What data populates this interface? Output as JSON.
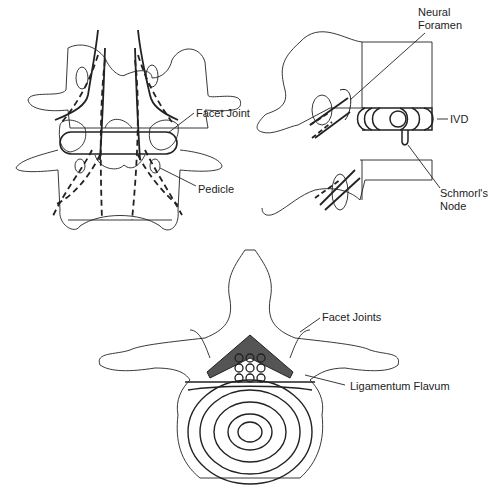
{
  "figure": {
    "panels": [
      {
        "id": "posterior-view",
        "labels": {
          "facet_joint": "Facet Joint",
          "pedicle": "Pedicle"
        }
      },
      {
        "id": "lateral-view",
        "labels": {
          "neural_foramen_1": "Neural",
          "neural_foramen_2": "Foramen",
          "ivd": "IVD",
          "schmorl_1": "Schmorl's",
          "schmorl_2": "Node"
        }
      },
      {
        "id": "axial-view",
        "labels": {
          "facet_joints": "Facet Joints",
          "ligamentum_flavum": "Ligamentum Flavum"
        }
      }
    ]
  },
  "colors": {
    "stroke": "#222222",
    "shade": "#555555",
    "background": "#ffffff"
  }
}
